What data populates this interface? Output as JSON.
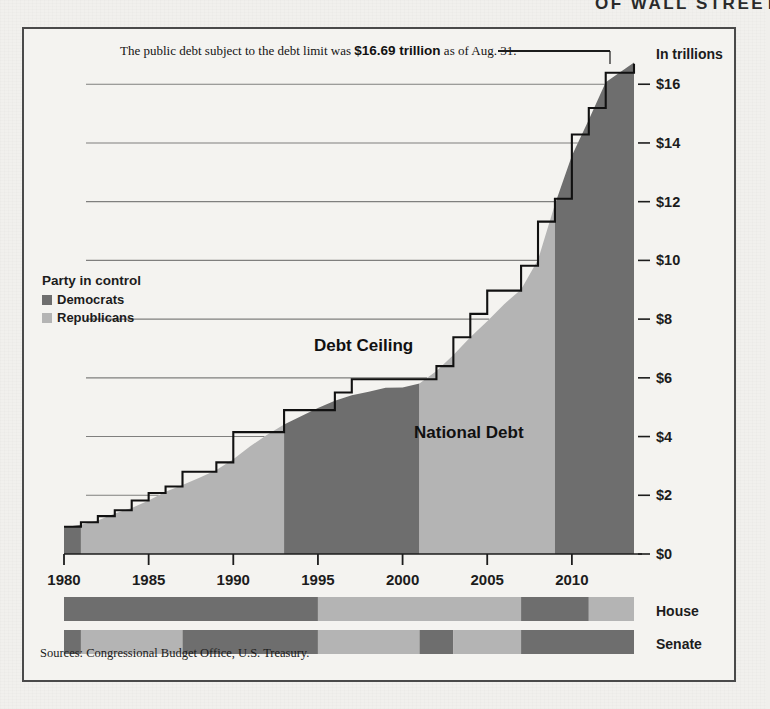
{
  "masthead_fragment": "OF WALL STREET",
  "annotation": {
    "prefix": "The public debt subject to the debt limit was ",
    "highlight": "$16.69 trillion",
    "suffix": " as of Aug. 31."
  },
  "legend": {
    "title": "Party in control",
    "items": [
      {
        "label": "Democrats",
        "color": "#6e6e6e"
      },
      {
        "label": "Republicans",
        "color": "#b4b4b4"
      }
    ]
  },
  "series_labels": {
    "ceiling": "Debt Ceiling",
    "debt": "National Debt"
  },
  "source": "Sources: Congressional Budget Office, U.S. Treasury.",
  "chamber_labels": {
    "house": "House",
    "senate": "Senate"
  },
  "colors": {
    "democrat": "#6e6e6e",
    "republican": "#b4b4b4",
    "line": "#111111",
    "grid": "#6b6b6b",
    "paper": "#f1f0ed",
    "frame": "#4a4a4a"
  },
  "chart_data": {
    "type": "area",
    "title": "",
    "xlabel": "",
    "ylabel": "In trillions",
    "xlim": [
      1980,
      2013.67
    ],
    "ylim": [
      0,
      17.2
    ],
    "grid": true,
    "yticks": [
      0,
      2,
      4,
      6,
      8,
      10,
      12,
      14,
      16
    ],
    "ytick_labels": [
      "$0",
      "$2",
      "$4",
      "$6",
      "$8",
      "$10",
      "$12",
      "$14",
      "$16"
    ],
    "xticks": [
      1980,
      1985,
      1990,
      1995,
      2000,
      2005,
      2010
    ],
    "xtick_labels": [
      "1980",
      "1985",
      "1990",
      "1995",
      "2000",
      "2005",
      "2010"
    ],
    "legend_position": "inside-left",
    "series": [
      {
        "name": "National Debt",
        "type": "area",
        "x": [
          1980,
          1981,
          1982,
          1983,
          1984,
          1985,
          1986,
          1987,
          1988,
          1989,
          1990,
          1991,
          1992,
          1993,
          1994,
          1995,
          1996,
          1997,
          1998,
          1999,
          2000,
          2001,
          2002,
          2003,
          2004,
          2005,
          2006,
          2007,
          2008,
          2009,
          2010,
          2011,
          2012,
          2013.67
        ],
        "values": [
          0.91,
          1.0,
          1.14,
          1.38,
          1.57,
          1.82,
          2.12,
          2.35,
          2.6,
          2.86,
          3.23,
          3.67,
          4.06,
          4.41,
          4.69,
          4.97,
          5.22,
          5.41,
          5.53,
          5.66,
          5.67,
          5.81,
          6.23,
          6.78,
          7.38,
          7.93,
          8.51,
          9.01,
          10.02,
          11.91,
          13.56,
          14.79,
          16.07,
          16.74
        ]
      },
      {
        "name": "Debt Ceiling",
        "type": "step",
        "x": [
          1980,
          1981,
          1982,
          1983,
          1984,
          1985,
          1986,
          1987,
          1988,
          1989,
          1990,
          1991,
          1992,
          1993,
          1994,
          1995,
          1996,
          1997,
          1998,
          1999,
          2000,
          2001,
          2002,
          2003,
          2004,
          2005,
          2006,
          2007,
          2008,
          2009,
          2010,
          2011,
          2012,
          2013.67
        ],
        "values": [
          0.93,
          1.08,
          1.29,
          1.49,
          1.82,
          2.08,
          2.3,
          2.8,
          2.8,
          3.12,
          4.15,
          4.15,
          4.15,
          4.9,
          4.9,
          4.9,
          5.5,
          5.95,
          5.95,
          5.95,
          5.95,
          5.95,
          6.4,
          7.38,
          8.18,
          8.97,
          8.97,
          9.82,
          11.32,
          12.1,
          14.29,
          15.19,
          16.39,
          16.7
        ]
      }
    ],
    "shading_bands": [
      {
        "from": 1980,
        "to": 1981,
        "party": "Democrats"
      },
      {
        "from": 1981,
        "to": 1993,
        "party": "Republicans"
      },
      {
        "from": 1993,
        "to": 2001,
        "party": "Democrats"
      },
      {
        "from": 2001,
        "to": 2009,
        "party": "Republicans"
      },
      {
        "from": 2009,
        "to": 2013.67,
        "party": "Democrats"
      }
    ],
    "annotation_value": 16.69,
    "annotation_date": "Aug. 31",
    "house_control": [
      {
        "from": 1980,
        "to": 1995,
        "party": "Democrats"
      },
      {
        "from": 1995,
        "to": 2007,
        "party": "Republicans"
      },
      {
        "from": 2007,
        "to": 2011,
        "party": "Democrats"
      },
      {
        "from": 2011,
        "to": 2013.67,
        "party": "Republicans"
      }
    ],
    "senate_control": [
      {
        "from": 1980,
        "to": 1981,
        "party": "Democrats"
      },
      {
        "from": 1981,
        "to": 1987,
        "party": "Republicans"
      },
      {
        "from": 1987,
        "to": 1995,
        "party": "Democrats"
      },
      {
        "from": 1995,
        "to": 2001,
        "party": "Republicans"
      },
      {
        "from": 2001,
        "to": 2003,
        "party": "Democrats"
      },
      {
        "from": 2003,
        "to": 2007,
        "party": "Republicans"
      },
      {
        "from": 2007,
        "to": 2013.67,
        "party": "Democrats"
      }
    ]
  }
}
